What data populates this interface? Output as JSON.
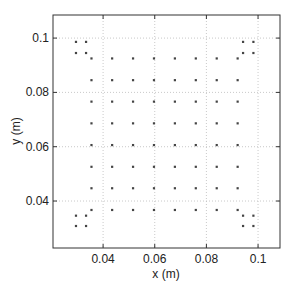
{
  "chart_data": {
    "type": "scatter",
    "title": "",
    "xlabel": "x (m)",
    "ylabel": "y (m)",
    "xlim": [
      0.0206,
      0.1085
    ],
    "ylim": [
      0.0227,
      0.1085
    ],
    "xticks": [
      0.04,
      0.06,
      0.08,
      0.1
    ],
    "yticks": [
      0.04,
      0.06,
      0.08,
      0.1
    ],
    "xtick_labels": [
      "0.04",
      "0.06",
      "0.08",
      "0.1"
    ],
    "ytick_labels": [
      "0.04",
      "0.06",
      "0.08",
      "0.1"
    ],
    "grid": true,
    "grid_style": "dotted",
    "legend": null,
    "marker_color": "#444444",
    "series": [
      {
        "name": "grid points",
        "x_values": [
          0.0355,
          0.0435,
          0.0516,
          0.0597,
          0.0678,
          0.0759,
          0.084,
          0.0921
        ],
        "y_values": [
          0.0925,
          0.0845,
          0.0766,
          0.0686,
          0.0606,
          0.0526,
          0.0447,
          0.0367
        ],
        "note": "full 8x8 lattice: every x_value paired with every y_value"
      },
      {
        "name": "corner clusters",
        "points": [
          [
            0.0295,
            0.0986
          ],
          [
            0.0334,
            0.0986
          ],
          [
            0.0295,
            0.0945
          ],
          [
            0.0334,
            0.0945
          ],
          [
            0.0942,
            0.0986
          ],
          [
            0.0982,
            0.0986
          ],
          [
            0.0942,
            0.0945
          ],
          [
            0.0982,
            0.0945
          ],
          [
            0.0295,
            0.0346
          ],
          [
            0.0334,
            0.0346
          ],
          [
            0.0295,
            0.0308
          ],
          [
            0.0334,
            0.0308
          ],
          [
            0.0942,
            0.0346
          ],
          [
            0.0982,
            0.0346
          ],
          [
            0.0942,
            0.0308
          ],
          [
            0.0982,
            0.0308
          ]
        ]
      }
    ]
  }
}
